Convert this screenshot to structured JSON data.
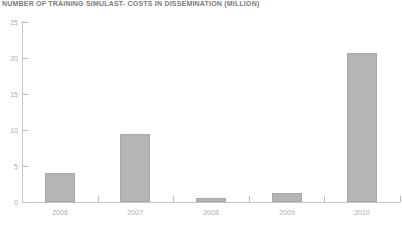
{
  "colors": {
    "background": "#ffffff",
    "bar_fill": "#b5b5b5",
    "bar_border": "#a8a8a8",
    "axis": "#c6c6c6",
    "tick": "#bdbdbd",
    "tick_label": "#adadad",
    "title": "#7a7a7a"
  },
  "chart_data": {
    "type": "bar",
    "title": "NUMBER OF TRAINING SIMULAST- COSTS IN DISSEMINATION (MILLION)",
    "categories": [
      "2006",
      "2007",
      "2008",
      "2009",
      "2010"
    ],
    "values": [
      4.0,
      9.5,
      0.5,
      1.3,
      20.7
    ],
    "xlabel": "",
    "ylabel": "",
    "ylim": [
      0,
      25
    ],
    "yticks": [
      0,
      5,
      10,
      15,
      20,
      25
    ],
    "grid": false,
    "legend": false,
    "layout": {
      "axis_left_px": 22,
      "axis_right_px": 400,
      "baseline_y_px": 202,
      "px_per_unit": 7.2,
      "bar_width_px": 30,
      "ytick_len_px": 5,
      "xtick_len_px": 6
    }
  }
}
